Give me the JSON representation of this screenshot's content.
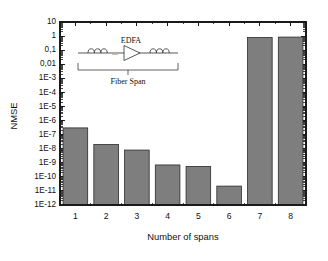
{
  "chart_data": {
    "type": "bar",
    "title": "",
    "xlabel": "Number of spans",
    "ylabel": "NMSE",
    "categories": [
      "1",
      "2",
      "3",
      "4",
      "5",
      "6",
      "7",
      "8"
    ],
    "values": [
      3e-07,
      2e-08,
      8e-09,
      7e-10,
      5.5e-10,
      2.2e-11,
      0.8,
      0.85
    ],
    "yscale": "log",
    "ylim": [
      1e-12,
      10
    ],
    "xlim": [
      0.5,
      8.5
    ],
    "grid": false,
    "legend": null,
    "ytick_labels": [
      "10",
      "1",
      "0,1",
      "0,01",
      "1E-3",
      "1E-4",
      "1E-5",
      "1E-6",
      "1E-7",
      "1E-8",
      "1E-9",
      "1E-10",
      "1E-11",
      "1E-12"
    ],
    "ytick_values": [
      10,
      1,
      0.1,
      0.01,
      0.001,
      0.0001,
      1e-05,
      1e-06,
      1e-07,
      1e-08,
      1e-09,
      1e-10,
      1e-11,
      1e-12
    ],
    "bar_color": "#7e7e7e",
    "bar_edge_color": "#2b2b2b",
    "axis_color": "#1a1a1a"
  },
  "inset": {
    "amplifier_label": "EDFA",
    "span_label": "Fiber Span",
    "ellipsis": "..."
  }
}
